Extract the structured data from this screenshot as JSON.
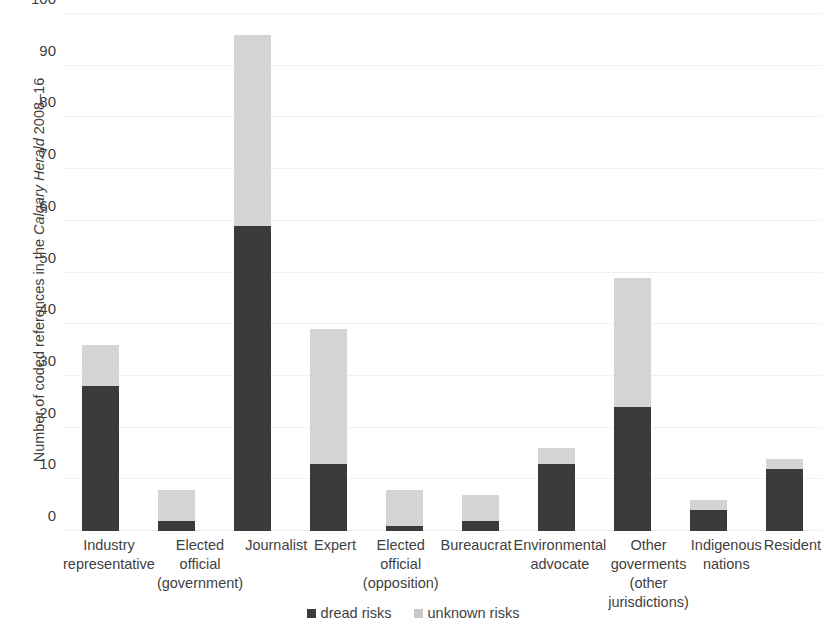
{
  "chart_data": {
    "type": "bar",
    "subtype": "stacked-vertical",
    "title": "",
    "xlabel": "",
    "ylabel": "Number of coded references in the Calgary Herald 2008–16",
    "ylabel_italic_part": "Calgary Herald",
    "ylim": [
      0,
      100
    ],
    "ytick_step": 10,
    "yticks": [
      0,
      10,
      20,
      30,
      40,
      50,
      60,
      70,
      80,
      90,
      100
    ],
    "grid": true,
    "legend_position": "bottom-center",
    "categories": [
      "Industry representative",
      "Elected official (government)",
      "Journalist",
      "Expert",
      "Elected official (opposition)",
      "Bureaucrat",
      "Environmental advocate",
      "Other goverments (other jurisdictions)",
      "Indigenous nations",
      "Resident"
    ],
    "category_labels_multiline": [
      "Industry\nrepresentative",
      "Elected\nofficial\n(government)",
      "Journalist",
      "Expert",
      "Elected\nofficial\n(opposition)",
      "Bureaucrat",
      "Environmental\nadvocate",
      "Other\ngoverments\n(other\njurisdictions)",
      "Indigenous\nnations",
      "Resident"
    ],
    "series": [
      {
        "name": "dread risks",
        "color": "#3b3b3b",
        "values": [
          28,
          2,
          59,
          13,
          1,
          2,
          13,
          24,
          4,
          12
        ]
      },
      {
        "name": "unknown risks",
        "color": "#d4d4d4",
        "values": [
          8,
          6,
          37,
          26,
          7,
          5,
          3,
          25,
          2,
          2
        ]
      }
    ],
    "totals": [
      36,
      8,
      96,
      39,
      8,
      7,
      16,
      49,
      6,
      14
    ]
  },
  "legend": {
    "items": [
      {
        "label": "dread risks",
        "swatch": "dread"
      },
      {
        "label": "unknown risks",
        "swatch": "unknown"
      }
    ]
  },
  "colors": {
    "dread": "#3b3b3b",
    "unknown": "#d4d4d4",
    "gridline": "#f0f0f0",
    "text": "#3f3f3f",
    "background": "#ffffff"
  }
}
